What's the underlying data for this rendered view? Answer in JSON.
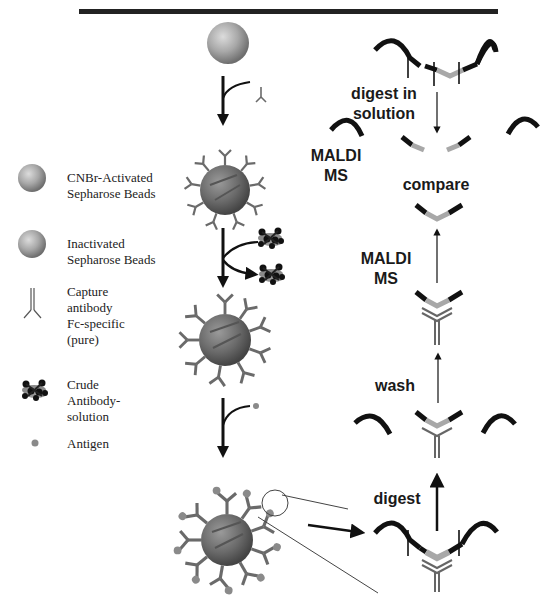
{
  "figure": {
    "title_fragment": ""
  },
  "legend": {
    "items": [
      {
        "icon": "cnbr-activated-bead-icon",
        "label": "CNBr-Activated\nSepharose Beads"
      },
      {
        "icon": "inactivated-bead-icon",
        "label": "Inactivated\nSepharose Beads"
      },
      {
        "icon": "capture-antibody-icon",
        "label": "Capture\nantibody\nFc-specific\n(pure)"
      },
      {
        "icon": "crude-antibody-solution-icon",
        "label": "Crude\nAntibody-\nsolution"
      },
      {
        "icon": "antigen-icon",
        "label": "Antigen"
      }
    ]
  },
  "workflow_right": {
    "labels": {
      "digest_in_solution": "digest in\nsolution",
      "maldi_ms_top": "MALDI\nMS",
      "compare": "compare",
      "maldi_ms_mid": "MALDI\nMS",
      "wash": "wash",
      "digest": "digest"
    }
  },
  "colors": {
    "bead_light": "#c8c8c8",
    "bead_dark": "#6e6e6e",
    "antibody_gray": "#6a6a6a",
    "epitope_gray": "#a8a8a8",
    "protein_black": "#111111",
    "antigen_dot": "#8a8a8a"
  }
}
